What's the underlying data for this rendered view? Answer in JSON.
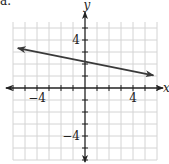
{
  "problem_label": "a.",
  "chart_data": {
    "type": "line",
    "title": "",
    "xlabel": "x",
    "ylabel": "y",
    "xlim": [
      -6,
      6
    ],
    "ylim": [
      -6,
      5.5
    ],
    "grid": true,
    "x_tick_labels": [
      {
        "value": -4,
        "label": "−4"
      },
      {
        "value": 4,
        "label": "4"
      }
    ],
    "y_tick_labels": [
      {
        "value": 4,
        "label": "4"
      },
      {
        "value": -4,
        "label": "−4"
      }
    ],
    "ticks_every": 1,
    "series": [
      {
        "name": "line",
        "slope": -0.2,
        "intercept": 2.2,
        "x_start": -5.6,
        "x_end": 5.7,
        "arrows": "both",
        "color": "#3a3a3a"
      }
    ],
    "colors": {
      "grid": "#d4d4d4",
      "axis": "#222222"
    }
  }
}
